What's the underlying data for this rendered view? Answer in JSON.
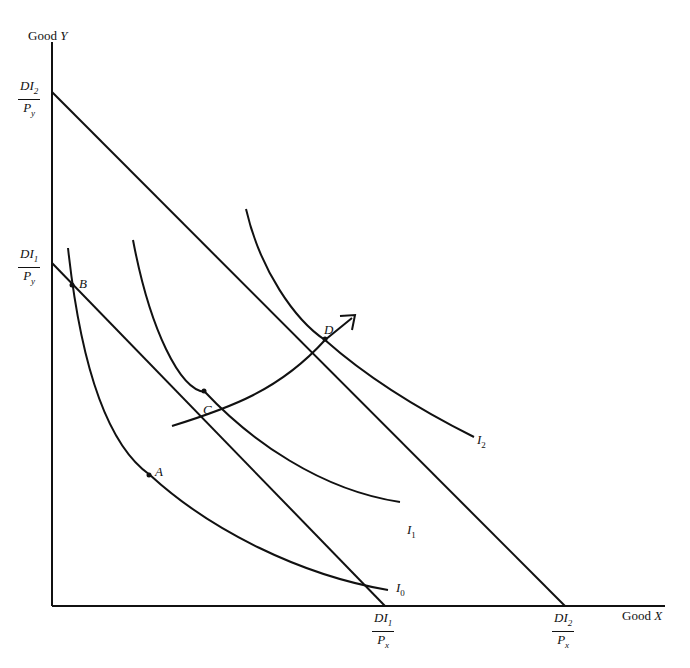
{
  "axes": {
    "y_label_text": "Good ",
    "y_label_var": "Y",
    "x_label_text": "Good ",
    "x_label_var": "X"
  },
  "intercepts": {
    "y2": {
      "num": "DI",
      "num_sub": "2",
      "den": "P",
      "den_sub": "y"
    },
    "y1": {
      "num": "DI",
      "num_sub": "1",
      "den": "P",
      "den_sub": "y"
    },
    "x1": {
      "num": "DI",
      "num_sub": "1",
      "den": "P",
      "den_sub": "x"
    },
    "x2": {
      "num": "DI",
      "num_sub": "2",
      "den": "P",
      "den_sub": "x"
    }
  },
  "points": {
    "A": "A",
    "B": "B",
    "C": "C",
    "D": "D"
  },
  "curves": {
    "I0": {
      "name": "I",
      "sub": "0"
    },
    "I1": {
      "name": "I",
      "sub": "1"
    },
    "I2": {
      "name": "I",
      "sub": "2"
    }
  },
  "colors": {
    "ink": "#111111",
    "background": "#ffffff"
  }
}
